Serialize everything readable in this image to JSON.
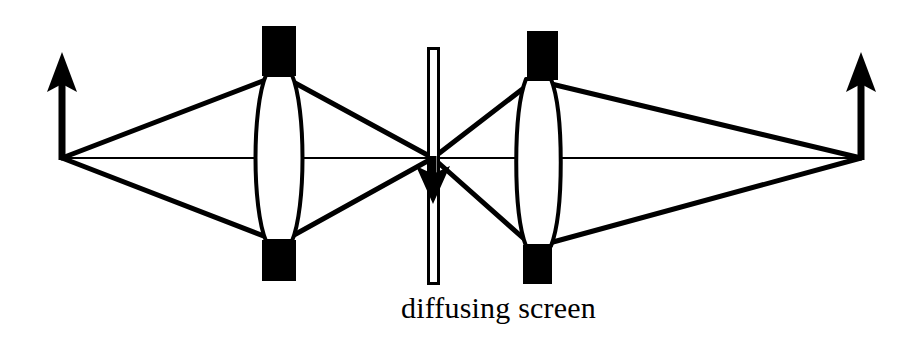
{
  "figure": {
    "name": "two-lens-imaging-system-with-diffusing-screen",
    "background_color": "#ffffff",
    "stroke_color": "#000000",
    "caption": "diffusing screen",
    "width": 919,
    "height": 346
  },
  "optical_axis": {
    "name": "optical-axis",
    "y": 158,
    "x_start": 62,
    "x_end": 862,
    "stroke_width": 2.2
  },
  "object_arrow": {
    "name": "object-arrow-upright",
    "label": "object",
    "direction": "up",
    "x": 62,
    "base_y": 158,
    "tip_y": 52,
    "shaft_width": 7,
    "head_width": 30,
    "head_length": 36
  },
  "intermediate_arrow": {
    "name": "intermediate-image-arrow-inverted",
    "label": "intermediate inverted image",
    "direction": "down",
    "x": 433,
    "base_y": 158,
    "tip_y": 204,
    "shaft_width": 7,
    "head_width": 34,
    "head_length": 34
  },
  "final_arrow": {
    "name": "final-image-arrow-upright",
    "label": "final image",
    "direction": "up",
    "x": 861,
    "base_y": 158,
    "tip_y": 52,
    "shaft_width": 7,
    "head_width": 30,
    "head_length": 36
  },
  "lens_left": {
    "name": "lens-left-biconvex",
    "label": "first converging lens",
    "center_x": 279,
    "center_y": 158,
    "half_width": 21,
    "neck_half_width": 13,
    "top_y": 75,
    "bottom_y": 241,
    "mount_top": {
      "x": 262,
      "y": 26,
      "width": 34,
      "height": 50
    },
    "mount_bottom": {
      "x": 262,
      "y": 240,
      "width": 34,
      "height": 41
    }
  },
  "lens_right": {
    "name": "lens-right-biconvex",
    "label": "second converging lens",
    "center_x": 538,
    "center_y": 158,
    "half_width": 20,
    "neck_half_width": 13,
    "top_y": 79,
    "bottom_y": 246,
    "mount_top": {
      "x": 527,
      "y": 31,
      "width": 31,
      "height": 49
    },
    "mount_bottom": {
      "x": 523,
      "y": 245,
      "width": 29,
      "height": 39
    }
  },
  "diffusing_screen": {
    "name": "diffusing-screen",
    "label": "diffusing screen",
    "x": 427,
    "y": 47,
    "width": 13,
    "height": 238,
    "fill": "#ffffff",
    "stroke": "#000000",
    "stroke_width": 3
  },
  "rays_left": {
    "name": "ray-bundle-left",
    "origin": {
      "x": 62,
      "y": 158
    },
    "converge": {
      "x": 433,
      "y": 158
    },
    "paths": [
      {
        "name": "upper-ray",
        "via": {
          "x": 275,
          "y": 76
        }
      },
      {
        "name": "lower-ray",
        "via": {
          "x": 275,
          "y": 240
        }
      },
      {
        "name": "axial-ray",
        "via": {
          "x": 279,
          "y": 158
        }
      }
    ]
  },
  "rays_right": {
    "name": "ray-bundle-right",
    "origin": {
      "x": 433,
      "y": 158
    },
    "converge": {
      "x": 861,
      "y": 158
    },
    "paths": [
      {
        "name": "upper-ray",
        "via": {
          "x": 534,
          "y": 80
        }
      },
      {
        "name": "lower-ray",
        "via": {
          "x": 534,
          "y": 245
        }
      },
      {
        "name": "axial-ray",
        "via": {
          "x": 538,
          "y": 158
        }
      }
    ]
  }
}
